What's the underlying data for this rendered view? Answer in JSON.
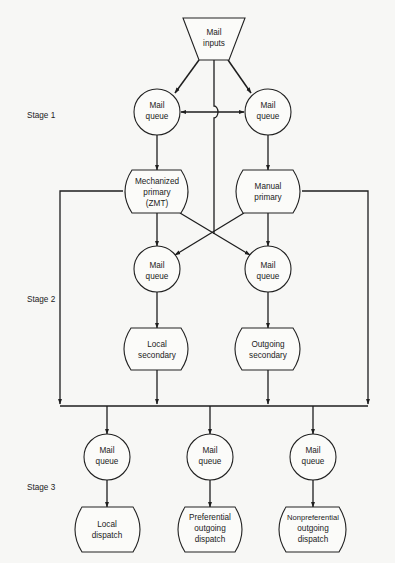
{
  "diagram": {
    "type": "flowchart",
    "stages": [
      {
        "id": "stage1",
        "label": "Stage 1"
      },
      {
        "id": "stage2",
        "label": "Stage 2"
      },
      {
        "id": "stage3",
        "label": "Stage 3"
      }
    ],
    "nodes": {
      "mail_inputs": {
        "shape": "trapezoid",
        "lines": [
          "Mail",
          "inputs"
        ]
      },
      "s1_queue_left": {
        "shape": "circle",
        "lines": [
          "Mail",
          "queue"
        ]
      },
      "s1_queue_right": {
        "shape": "circle",
        "lines": [
          "Mail",
          "queue"
        ]
      },
      "mechanized_primary": {
        "shape": "process",
        "lines": [
          "Mechanized",
          "primary",
          "(ZMT)"
        ]
      },
      "manual_primary": {
        "shape": "process",
        "lines": [
          "Manual",
          "primary"
        ]
      },
      "s2_queue_left": {
        "shape": "circle",
        "lines": [
          "Mail",
          "queue"
        ]
      },
      "s2_queue_right": {
        "shape": "circle",
        "lines": [
          "Mail",
          "queue"
        ]
      },
      "local_secondary": {
        "shape": "process",
        "lines": [
          "Local",
          "secondary"
        ]
      },
      "outgoing_secondary": {
        "shape": "process",
        "lines": [
          "Outgoing",
          "secondary"
        ]
      },
      "s3_queue_1": {
        "shape": "circle",
        "lines": [
          "Mail",
          "queue"
        ]
      },
      "s3_queue_2": {
        "shape": "circle",
        "lines": [
          "Mail",
          "queue"
        ]
      },
      "s3_queue_3": {
        "shape": "circle",
        "lines": [
          "Mail",
          "queue"
        ]
      },
      "local_dispatch": {
        "shape": "process",
        "lines": [
          "Local",
          "dispatch"
        ]
      },
      "preferential_dispatch": {
        "shape": "process",
        "lines": [
          "Preferential",
          "outgoing",
          "dispatch"
        ]
      },
      "nonpreferential_dispatch": {
        "shape": "process",
        "lines": [
          "Nonpreferential",
          "outgoing",
          "dispatch"
        ]
      }
    },
    "edges": [
      {
        "from": "mail_inputs",
        "to": "s1_queue_left"
      },
      {
        "from": "mail_inputs",
        "to": "s1_queue_right"
      },
      {
        "from": "mail_inputs",
        "to": "s2_queue_left",
        "via": "center crossing"
      },
      {
        "from": "mail_inputs",
        "to": "s2_queue_right",
        "via": "center crossing"
      },
      {
        "from": "s1_queue_left",
        "to": "s1_queue_right",
        "bidirectional": true
      },
      {
        "from": "s1_queue_left",
        "to": "mechanized_primary"
      },
      {
        "from": "s1_queue_right",
        "to": "manual_primary"
      },
      {
        "from": "mechanized_primary",
        "to": "s2_queue_left"
      },
      {
        "from": "mechanized_primary",
        "to": "s2_queue_right"
      },
      {
        "from": "manual_primary",
        "to": "s2_queue_left"
      },
      {
        "from": "manual_primary",
        "to": "s2_queue_right"
      },
      {
        "from": "mechanized_primary",
        "to": "stage3_bus"
      },
      {
        "from": "manual_primary",
        "to": "stage3_bus"
      },
      {
        "from": "s2_queue_left",
        "to": "local_secondary"
      },
      {
        "from": "s2_queue_right",
        "to": "outgoing_secondary"
      },
      {
        "from": "local_secondary",
        "to": "stage3_bus"
      },
      {
        "from": "outgoing_secondary",
        "to": "stage3_bus"
      },
      {
        "from": "stage3_bus",
        "to": "s3_queue_1"
      },
      {
        "from": "stage3_bus",
        "to": "s3_queue_2"
      },
      {
        "from": "stage3_bus",
        "to": "s3_queue_3"
      },
      {
        "from": "s3_queue_1",
        "to": "local_dispatch"
      },
      {
        "from": "s3_queue_2",
        "to": "preferential_dispatch"
      },
      {
        "from": "s3_queue_3",
        "to": "nonpreferential_dispatch"
      }
    ]
  }
}
